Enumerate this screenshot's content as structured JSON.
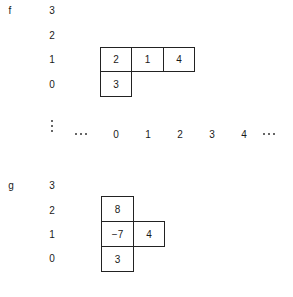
{
  "diagram_f": {
    "name": "f",
    "row_labels": [
      "3",
      "2",
      "1",
      "0"
    ],
    "cells": [
      {
        "row": 1,
        "col": 0,
        "value": "2"
      },
      {
        "row": 1,
        "col": 1,
        "value": "1"
      },
      {
        "row": 1,
        "col": 2,
        "value": "4"
      },
      {
        "row": 0,
        "col": 0,
        "value": "3"
      }
    ]
  },
  "axis": {
    "column_labels": [
      "0",
      "1",
      "2",
      "3",
      "4"
    ],
    "leading_ellipsis": "...",
    "trailing_ellipsis": "...",
    "vertical_ellipsis": "⋮"
  },
  "diagram_g": {
    "name": "g",
    "row_labels": [
      "3",
      "2",
      "1",
      "0"
    ],
    "cells": [
      {
        "row": 2,
        "col": 0,
        "value": "8"
      },
      {
        "row": 1,
        "col": 0,
        "value": "−7"
      },
      {
        "row": 1,
        "col": 1,
        "value": "4"
      },
      {
        "row": 0,
        "col": 0,
        "value": "3"
      }
    ]
  }
}
